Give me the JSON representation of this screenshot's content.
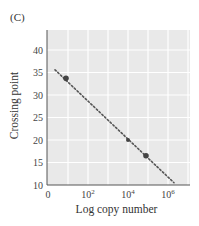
{
  "panel_label": "(C)",
  "chart_data": {
    "type": "scatter",
    "title": "",
    "xlabel": "Log copy number",
    "ylabel": "Crossing point",
    "x_scale": "log10",
    "xlim_log10": [
      0,
      6.9
    ],
    "ylim": [
      10,
      45
    ],
    "x_ticks": [
      {
        "log10": 0,
        "label": "0",
        "sup": ""
      },
      {
        "log10": 2,
        "label": "10",
        "sup": "2"
      },
      {
        "log10": 4,
        "label": "10",
        "sup": "4"
      },
      {
        "log10": 6,
        "label": "10",
        "sup": "6"
      }
    ],
    "y_ticks": [
      10,
      15,
      20,
      25,
      30,
      35,
      40
    ],
    "grid": true,
    "points": [
      {
        "x_log10": 0.9,
        "y": 33.7,
        "size": "large"
      },
      {
        "x_log10": 4.0,
        "y": 20.0,
        "size": "small"
      },
      {
        "x_log10": 4.9,
        "y": 16.5,
        "size": "large"
      }
    ],
    "fit_line": {
      "style": "dotted",
      "x_log10": [
        0.35,
        6.3
      ],
      "y": [
        35.6,
        10.5
      ]
    },
    "colors": {
      "plot_bg": "#e9e9e9",
      "grid": "#ffffff",
      "line": "#555555",
      "point": "#444444"
    }
  }
}
